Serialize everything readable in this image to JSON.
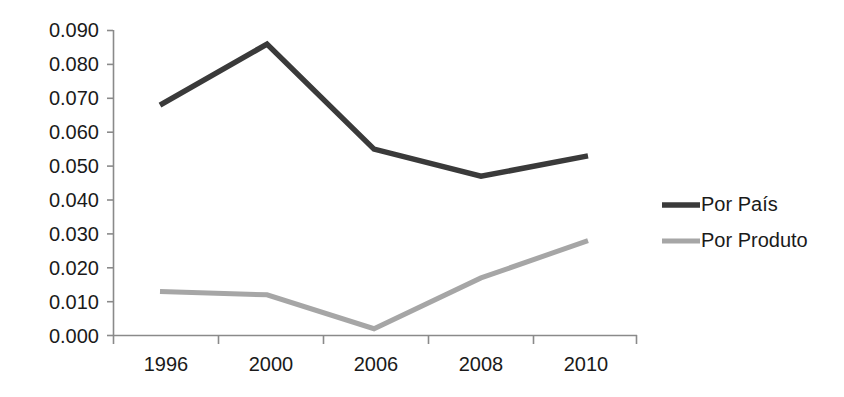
{
  "chart_data": {
    "type": "line",
    "title": "",
    "subtitle": "",
    "xlabel": "",
    "ylabel": "",
    "categories": [
      "1996",
      "2000",
      "2006",
      "2008",
      "2010"
    ],
    "series": [
      {
        "name": "Por País",
        "color": "#3a3a3a",
        "values": [
          0.068,
          0.086,
          0.055,
          0.047,
          0.053
        ]
      },
      {
        "name": "Por Produto",
        "color": "#a6a6a6",
        "values": [
          0.013,
          0.012,
          0.002,
          0.017,
          0.028
        ]
      }
    ],
    "ylim": [
      0.0,
      0.09
    ],
    "ytick_labels": [
      "0.090",
      "0.080",
      "0.070",
      "0.060",
      "0.050",
      "0.040",
      "0.030",
      "0.020",
      "0.010",
      "0.000"
    ],
    "ytick_values": [
      0.09,
      0.08,
      0.07,
      0.06,
      0.05,
      0.04,
      0.03,
      0.02,
      0.01,
      0.0
    ],
    "grid": false,
    "legend_position": "right",
    "legend": [
      {
        "label": "Por País",
        "color": "#3a3a3a",
        "swatch": "thick-dark-line"
      },
      {
        "label": "Por Produto",
        "color": "#a6a6a6",
        "swatch": "thick-gray-line"
      }
    ],
    "axis_color": "#8a8a8a",
    "background": "#ffffff"
  }
}
